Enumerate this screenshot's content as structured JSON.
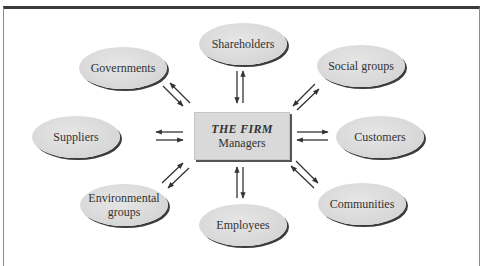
{
  "diagram": {
    "center": {
      "title": "THE FIRM",
      "subtitle": "Managers"
    },
    "stakeholders": [
      {
        "id": "shareholders",
        "label": "Shareholders",
        "position": "top"
      },
      {
        "id": "governments",
        "label": "Governments",
        "position": "top-left"
      },
      {
        "id": "social-groups",
        "label": "Social groups",
        "position": "top-right"
      },
      {
        "id": "suppliers",
        "label": "Suppliers",
        "position": "left"
      },
      {
        "id": "customers",
        "label": "Customers",
        "position": "right"
      },
      {
        "id": "environmental-groups",
        "label": "Environmental groups",
        "position": "bottom-left"
      },
      {
        "id": "communities",
        "label": "Communities",
        "position": "bottom-right"
      },
      {
        "id": "employees",
        "label": "Employees",
        "position": "bottom"
      }
    ],
    "connections": "bidirectional arrows between the firm and each stakeholder",
    "colors": {
      "node_fill": "#d9d9d9",
      "node_shadow": "#3c3c3c",
      "arrow": "#333333",
      "frame_top": "#3a3a3a",
      "text": "#333333"
    }
  }
}
